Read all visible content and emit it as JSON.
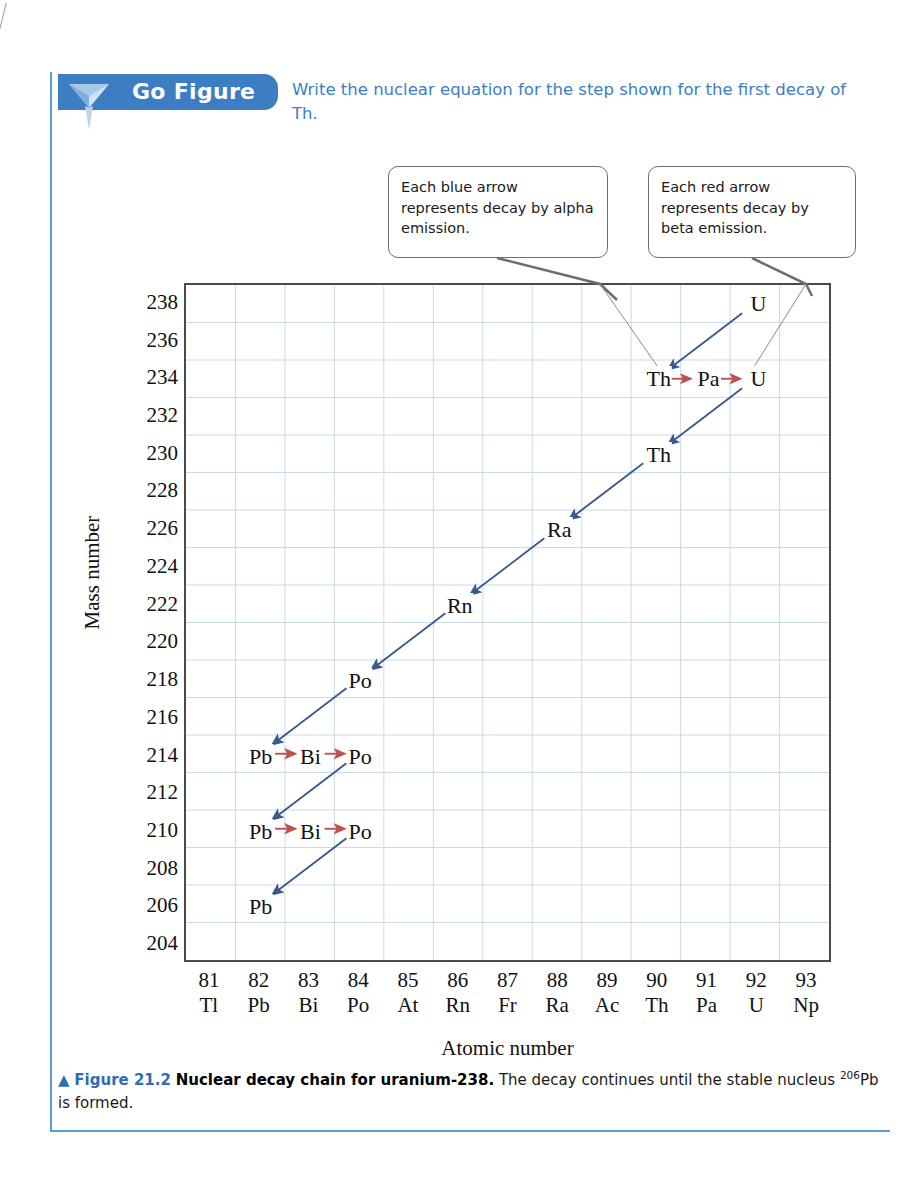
{
  "go_figure": {
    "banner_label": "Go Figure",
    "triangle_icon": "triangle-down-icon",
    "prompt": "Write the nuclear equation for the step shown for the first decay of Th."
  },
  "callouts": [
    {
      "id": "alpha",
      "text": "Each blue arrow represents decay by alpha emission."
    },
    {
      "id": "beta",
      "text": "Each red arrow represents decay by beta emission."
    }
  ],
  "caption": {
    "arrow": "▲",
    "figure_number": "Figure 21.2",
    "title": "Nuclear decay chain for uranium-238.",
    "rest_before": " The decay continues until the stable nucleus ",
    "superscript": "206",
    "element": "Pb",
    "rest_after": " is formed."
  },
  "colors": {
    "banner_blue": "#3d7dc4",
    "prompt_blue": "#3d7dc4",
    "frame_blue": "#5b9bd5",
    "alpha_arrow": "#3b5a8c",
    "beta_arrow": "#c0504d",
    "grid": "#c9dbe8",
    "axis": "#4a4a4a",
    "callout_border": "#6e6e6e"
  },
  "chart_data": {
    "type": "scatter",
    "title": "Nuclear decay chain for uranium-238",
    "xlabel": "Atomic number",
    "ylabel": "Mass number",
    "xlim": [
      80.5,
      93.5
    ],
    "ylim": [
      203,
      239
    ],
    "grid": true,
    "legend_position": "callout-boxes",
    "x_ticks": [
      81,
      82,
      83,
      84,
      85,
      86,
      87,
      88,
      89,
      90,
      91,
      92,
      93
    ],
    "x_tick_symbols": [
      "Tl",
      "Pb",
      "Bi",
      "Po",
      "At",
      "Rn",
      "Fr",
      "Ra",
      "Ac",
      "Th",
      "Pa",
      "U",
      "Np"
    ],
    "y_ticks": [
      238,
      236,
      234,
      232,
      230,
      228,
      226,
      224,
      222,
      220,
      218,
      216,
      214,
      212,
      210,
      208,
      206,
      204
    ],
    "nuclides": [
      {
        "label": "U",
        "z": 92,
        "a": 238
      },
      {
        "label": "Th",
        "z": 90,
        "a": 234
      },
      {
        "label": "Pa",
        "z": 91,
        "a": 234
      },
      {
        "label": "U",
        "z": 92,
        "a": 234
      },
      {
        "label": "Th",
        "z": 90,
        "a": 230
      },
      {
        "label": "Ra",
        "z": 88,
        "a": 226
      },
      {
        "label": "Rn",
        "z": 86,
        "a": 222
      },
      {
        "label": "Po",
        "z": 84,
        "a": 218
      },
      {
        "label": "Pb",
        "z": 82,
        "a": 214
      },
      {
        "label": "Bi",
        "z": 83,
        "a": 214
      },
      {
        "label": "Po",
        "z": 84,
        "a": 214
      },
      {
        "label": "Pb",
        "z": 82,
        "a": 210
      },
      {
        "label": "Bi",
        "z": 83,
        "a": 210
      },
      {
        "label": "Po",
        "z": 84,
        "a": 210
      },
      {
        "label": "Pb",
        "z": 82,
        "a": 206
      }
    ],
    "decays": [
      {
        "from": [
          92,
          238
        ],
        "to": [
          90,
          234
        ],
        "type": "alpha"
      },
      {
        "from": [
          90,
          234
        ],
        "to": [
          91,
          234
        ],
        "type": "beta"
      },
      {
        "from": [
          91,
          234
        ],
        "to": [
          92,
          234
        ],
        "type": "beta"
      },
      {
        "from": [
          92,
          234
        ],
        "to": [
          90,
          230
        ],
        "type": "alpha"
      },
      {
        "from": [
          90,
          230
        ],
        "to": [
          88,
          226
        ],
        "type": "alpha"
      },
      {
        "from": [
          88,
          226
        ],
        "to": [
          86,
          222
        ],
        "type": "alpha"
      },
      {
        "from": [
          86,
          222
        ],
        "to": [
          84,
          218
        ],
        "type": "alpha"
      },
      {
        "from": [
          84,
          218
        ],
        "to": [
          82,
          214
        ],
        "type": "alpha"
      },
      {
        "from": [
          82,
          214
        ],
        "to": [
          83,
          214
        ],
        "type": "beta"
      },
      {
        "from": [
          83,
          214
        ],
        "to": [
          84,
          214
        ],
        "type": "beta"
      },
      {
        "from": [
          84,
          214
        ],
        "to": [
          82,
          210
        ],
        "type": "alpha"
      },
      {
        "from": [
          82,
          210
        ],
        "to": [
          83,
          210
        ],
        "type": "beta"
      },
      {
        "from": [
          83,
          210
        ],
        "to": [
          84,
          210
        ],
        "type": "beta"
      },
      {
        "from": [
          84,
          210
        ],
        "to": [
          82,
          206
        ],
        "type": "alpha"
      }
    ]
  }
}
